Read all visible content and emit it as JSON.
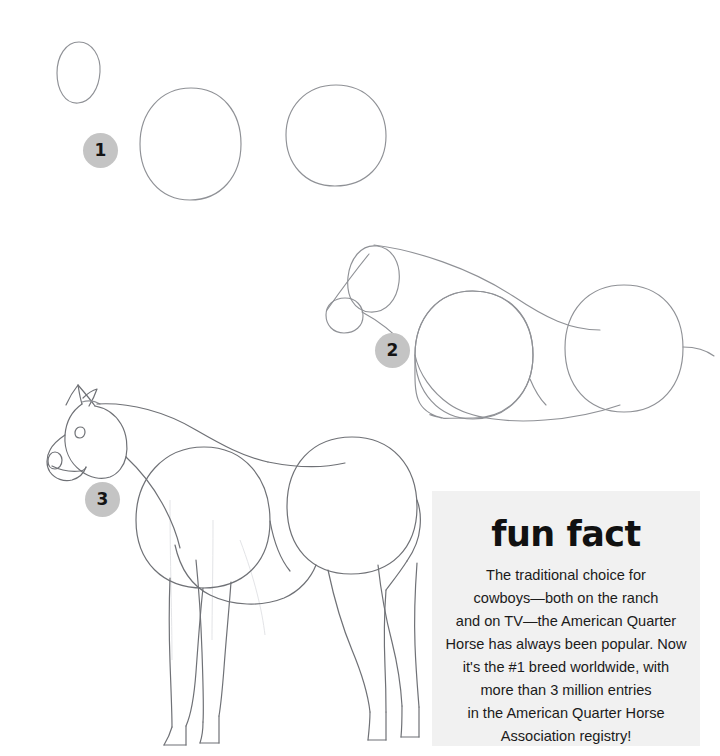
{
  "page": {
    "background_color": "#ffffff",
    "width": 720,
    "height": 756
  },
  "steps": [
    {
      "id": "step-1",
      "number": "1",
      "description": "Three basic shapes: a small egg shape for the head and two large circles for the body masses."
    },
    {
      "id": "step-2",
      "number": "2",
      "description": "Add the muzzle circle, connect the head to the body with the neck, and outline the topline and belly."
    },
    {
      "id": "step-3",
      "number": "3",
      "description": "Refine the head with ears, eye and nostril, then draw the four legs."
    }
  ],
  "badge": {
    "background_color": "#c4c4c4",
    "text_color": "#141414"
  },
  "sketch": {
    "line_color": "#8f9196",
    "ghost_color": "#e3e4e7"
  },
  "fun_fact": {
    "title": "fun fact",
    "background_color": "#f1f1f1",
    "text_color": "#1b1b1b",
    "body": "The traditional choice for\ncowboys—both on the ranch\nand on TV—the American Quarter\nHorse has always been popular. Now\nit's the #1 breed worldwide, with\nmore than 3 million entries\nin the American Quarter Horse\nAssociation registry!",
    "body_lines": [
      "The traditional choice for",
      "cowboys—both on the ranch",
      "and on TV—the American Quarter",
      "Horse has always been popular. Now",
      "it's the #1 breed worldwide, with",
      "more than 3 million entries",
      "in the American Quarter Horse",
      "Association registry!"
    ]
  }
}
